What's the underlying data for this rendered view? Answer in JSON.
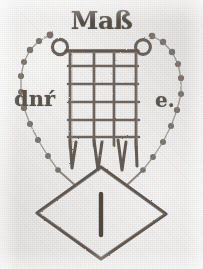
{
  "image": {
    "kind": "watermark-mark-drawing",
    "width": 203,
    "height": 269,
    "background_color": "#e9e7e6",
    "ink_color": "#6f675f",
    "ink_color_dark": "#554e47"
  },
  "inscriptions": {
    "top": "Maß",
    "left": "dnŕ",
    "right": "e.",
    "lozenge": "I"
  },
  "device": {
    "name": "grid-rake-mark",
    "grid_vertical_lines": 4,
    "grid_horizontal_lines": 5,
    "prongs": 3,
    "rings": 2,
    "beads_per_side": 9,
    "lozenge_shape": "diamond"
  },
  "labels": {
    "figure": "Maker's mark with grid device, beaded surround and lozenge",
    "top_inscription": "top inscription",
    "left_inscription": "left inscription",
    "right_inscription": "right inscription",
    "lozenge_inscription": "lozenge inscription"
  }
}
